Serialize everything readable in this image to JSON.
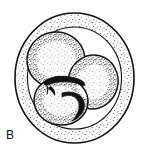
{
  "figure": {
    "panel_label": "B",
    "caption_present": false,
    "style": "stippled line drawing",
    "colors": {
      "background": "#ffffff",
      "ink": "#111111",
      "stipple": "#2b2b2b",
      "fill": "#ffffff"
    },
    "zona_pellucida": {
      "name": "zona-pellucida",
      "center_x": 74.5,
      "center_y": 78,
      "radius_x": 59.5,
      "radius_y": 65,
      "stroke_width": 1.6,
      "fill": "#ffffff"
    },
    "blastomeres": [
      {
        "name": "blastomere-upper-left",
        "center_x": 56,
        "center_y": 60,
        "radius_x": 29,
        "radius_y": 28,
        "rotation": -8
      },
      {
        "name": "blastomere-right",
        "center_x": 93,
        "center_y": 82,
        "radius_x": 25,
        "radius_y": 27,
        "rotation": 14
      },
      {
        "name": "blastomere-lower-left",
        "center_x": 61,
        "center_y": 101,
        "radius_x": 27,
        "radius_y": 24,
        "rotation": 6
      }
    ],
    "cell_junctions": [
      {
        "name": "junction-upper-central",
        "path": "M 44 82 C 52 75, 66 75, 78 79 C 84 81, 86 84, 84 86 C 76 82, 62 80, 50 84 C 46 86, 43 85, 44 82 Z"
      },
      {
        "name": "junction-lower-central",
        "path": "M 62 93 C 72 90, 82 94, 84 102 C 86 110, 80 118, 72 121 C 78 115, 81 107, 78 101 C 75 95, 68 94, 62 97 Z"
      },
      {
        "name": "junction-left-spur",
        "path": "M 50 86 C 54 88, 56 92, 55 96 C 53 93, 51 90, 48 89 Z"
      }
    ]
  }
}
